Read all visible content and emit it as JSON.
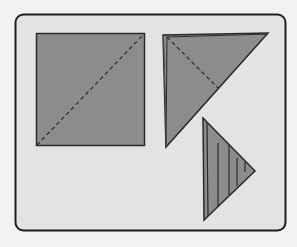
{
  "diagram": {
    "title": "",
    "colors": {
      "background": "#f2f2f2",
      "panel": "#e3e3e3",
      "frame": "#1e1e1e",
      "shape_fill": "#8c8c8c",
      "shape_stroke": "#2a2a2a"
    },
    "steps": [
      {
        "id": "step-1",
        "shape": "square",
        "fold_line": "diagonal-dashed"
      },
      {
        "id": "step-2",
        "shape": "right-triangle",
        "fold_line": "dashed-bisector"
      },
      {
        "id": "step-3",
        "shape": "small-triangle",
        "pattern": "vertical-hatch"
      }
    ]
  }
}
